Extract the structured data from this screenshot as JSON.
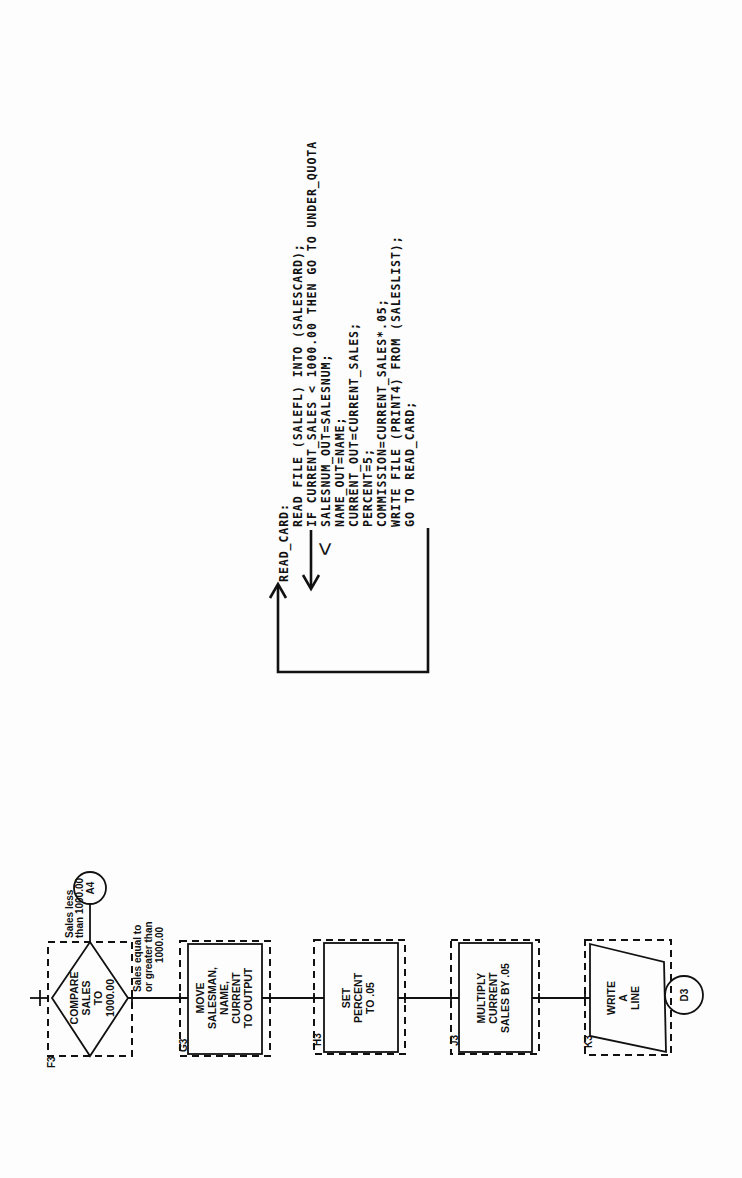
{
  "code_block": {
    "label": "READ_CARD:",
    "lines": [
      "READ FILE (SALEFL) INTO (SALESCARD);",
      "IF CURRENT_SALES < 1000.00 THEN GO TO UNDER_QUOTA",
      "SALESNUM_OUT=SALESNUM;",
      "NAME_OUT=NAME;",
      "CURRENT_OUT=CURRENT_SALES;",
      "PERCENT=5;",
      "COMMISSION=CURRENT_SALES*.05;",
      "WRITE FILE (PRINT4) FROM (SALESLIST);",
      "GO TO READ_CARD;"
    ],
    "branch_marker": "<"
  },
  "flowchart": {
    "blocks": [
      {
        "id": "F3",
        "type": "decision",
        "lines": [
          "COMPARE",
          "SALES",
          "TO",
          "1000.00"
        ]
      },
      {
        "id": "G3",
        "type": "process",
        "lines": [
          "MOVE",
          "SALESMAN,",
          "NAME,",
          "CURRENT",
          "TO OUTPUT"
        ]
      },
      {
        "id": "H3",
        "type": "process",
        "lines": [
          "SET",
          "PERCENT",
          "TO .05"
        ]
      },
      {
        "id": "J3",
        "type": "process",
        "lines": [
          "MULTIPLY",
          "CURRENT",
          "SALES BY .05"
        ]
      },
      {
        "id": "K3",
        "type": "io",
        "lines": [
          "WRITE",
          "A",
          "LINE"
        ]
      }
    ],
    "branch_less": [
      "Sales less",
      "than 1000.00"
    ],
    "branch_greater": [
      "Sales equal to",
      "or greater than",
      "1000.00"
    ],
    "connectors": {
      "less_target": "A4",
      "exit_target": "D3"
    }
  }
}
